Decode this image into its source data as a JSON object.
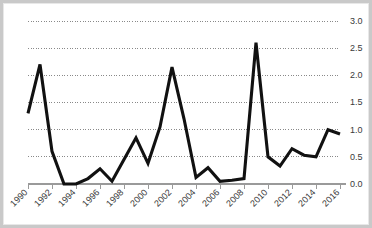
{
  "chart_data": {
    "type": "line",
    "title": "",
    "subtitle": "",
    "xlabel": "",
    "ylabel": "",
    "x": [
      1990,
      1991,
      1992,
      1993,
      1994,
      1995,
      1996,
      1997,
      1998,
      1999,
      2000,
      2001,
      2002,
      2003,
      2004,
      2005,
      2006,
      2007,
      2008,
      2009,
      2010,
      2011,
      2012,
      2013,
      2014,
      2015,
      2016
    ],
    "values": [
      1.3,
      2.2,
      0.6,
      0.0,
      0.0,
      0.1,
      0.28,
      0.05,
      0.45,
      0.85,
      0.38,
      1.05,
      2.15,
      1.2,
      0.12,
      0.3,
      0.05,
      0.07,
      0.1,
      2.6,
      0.5,
      0.33,
      0.65,
      0.53,
      0.5,
      1.0,
      0.92
    ],
    "series": [
      {
        "name": "value",
        "color": "#111111",
        "values": [
          1.3,
          2.2,
          0.6,
          0.0,
          0.0,
          0.1,
          0.28,
          0.05,
          0.45,
          0.85,
          0.38,
          1.05,
          2.15,
          1.2,
          0.12,
          0.3,
          0.05,
          0.07,
          0.1,
          2.6,
          0.5,
          0.33,
          0.65,
          0.53,
          0.5,
          1.0,
          0.92
        ]
      }
    ],
    "xlim": [
      1990,
      2016
    ],
    "ylim": [
      0.0,
      3.0
    ],
    "yticks": [
      0.0,
      0.5,
      1.0,
      1.5,
      2.0,
      2.5,
      3.0
    ],
    "ytick_labels": [
      "0.0",
      "0.5",
      "1.0",
      "1.5",
      "2.0",
      "2.5",
      "3.0"
    ],
    "xticks": [
      1990,
      1992,
      1994,
      1996,
      1998,
      2000,
      2002,
      2004,
      2006,
      2008,
      2010,
      2012,
      2014,
      2016
    ],
    "xtick_labels": [
      "1990",
      "1992",
      "1994",
      "1996",
      "1998",
      "2000",
      "2002",
      "2004",
      "2006",
      "2008",
      "2010",
      "2012",
      "2014",
      "2016"
    ],
    "xtick_rotation": -45,
    "grid": true,
    "grid_axis": "y",
    "grid_style": "dotted",
    "y_axis_position": "right",
    "legend": false,
    "legend_position": "none",
    "colors": {
      "line": "#111111",
      "grid": "#6b6b6b",
      "axis": "#9a9a9a",
      "tick_text": "#3a3a3a",
      "background": "#ffffff",
      "frame_border": "#c9c9c9"
    }
  }
}
